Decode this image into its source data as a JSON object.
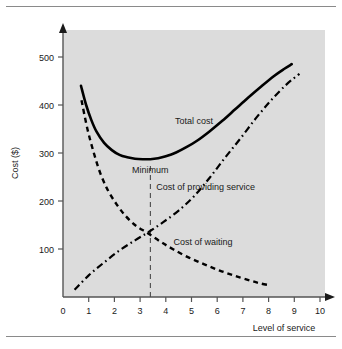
{
  "figure": {
    "background_color": "#ffffff",
    "plot_background_color": "#dcdcdc",
    "rule_color": "#8a8a8a",
    "line_color": "#000000"
  },
  "chart_data": {
    "type": "line",
    "title": "",
    "xlabel": "Level of service",
    "ylabel": "Cost ($)",
    "xlim": [
      0,
      11
    ],
    "ylim": [
      0,
      560
    ],
    "xticks": [
      0,
      1,
      2,
      3,
      4,
      5,
      6,
      7,
      8,
      9,
      10
    ],
    "xtick_labels": [
      "0",
      "1",
      "2",
      "3",
      "4",
      "5",
      "6",
      "7",
      "8",
      "9",
      "10"
    ],
    "yticks": [
      100,
      200,
      300,
      400,
      500
    ],
    "ytick_labels": [
      "100",
      "200",
      "300",
      "400",
      "500"
    ],
    "grid": false,
    "legend_position": "inline-labels",
    "series": [
      {
        "name": "Total cost",
        "style": "solid",
        "label": "Total cost",
        "label_x": 5.1,
        "label_y": 360,
        "points": [
          [
            0.7,
            440
          ],
          [
            0.9,
            400
          ],
          [
            1.1,
            369
          ],
          [
            1.3,
            345
          ],
          [
            1.6,
            321
          ],
          [
            1.9,
            306
          ],
          [
            2.2,
            296
          ],
          [
            2.5,
            291
          ],
          [
            2.8,
            288
          ],
          [
            3.1,
            287
          ],
          [
            3.4,
            287
          ],
          [
            3.7,
            289
          ],
          [
            4.0,
            293
          ],
          [
            4.4,
            301
          ],
          [
            4.8,
            312
          ],
          [
            5.2,
            325
          ],
          [
            5.7,
            345
          ],
          [
            6.2,
            367
          ],
          [
            6.7,
            391
          ],
          [
            7.2,
            415
          ],
          [
            7.7,
            438
          ],
          [
            8.2,
            460
          ],
          [
            8.6,
            475
          ],
          [
            8.9,
            485
          ]
        ]
      },
      {
        "name": "Cost of providing service",
        "style": "dashdot",
        "label": "Cost of providing service",
        "label_x": 5.55,
        "label_y": 222,
        "points": [
          [
            0.45,
            15
          ],
          [
            1.0,
            45
          ],
          [
            1.6,
            72
          ],
          [
            2.2,
            97
          ],
          [
            2.8,
            118
          ],
          [
            3.35,
            136
          ],
          [
            3.9,
            156
          ],
          [
            4.5,
            180
          ],
          [
            5.1,
            210
          ],
          [
            5.7,
            248
          ],
          [
            6.3,
            290
          ],
          [
            6.9,
            330
          ],
          [
            7.5,
            372
          ],
          [
            8.1,
            410
          ],
          [
            8.7,
            443
          ],
          [
            9.2,
            465
          ]
        ]
      },
      {
        "name": "Cost of waiting",
        "style": "dashed",
        "label": "Cost of waiting",
        "label_x": 5.45,
        "label_y": 108,
        "points": [
          [
            0.72,
            410
          ],
          [
            0.95,
            350
          ],
          [
            1.2,
            300
          ],
          [
            1.45,
            258
          ],
          [
            1.75,
            222
          ],
          [
            2.1,
            192
          ],
          [
            2.45,
            168
          ],
          [
            2.85,
            148
          ],
          [
            3.3,
            133
          ],
          [
            3.8,
            115
          ],
          [
            4.3,
            99
          ],
          [
            4.9,
            82
          ],
          [
            5.5,
            68
          ],
          [
            6.1,
            55
          ],
          [
            6.7,
            44
          ],
          [
            7.3,
            34
          ],
          [
            7.7,
            28
          ],
          [
            8.0,
            25
          ]
        ]
      }
    ],
    "annotations": [
      {
        "name": "minimum",
        "text": "Minimum",
        "x": 3.4,
        "y": 258
      },
      {
        "name": "optimal-level",
        "text": "Optimal level",
        "x": 3.0,
        "y": -70
      }
    ],
    "reference_lines": [
      {
        "name": "optimal-level-marker",
        "orientation": "vertical",
        "x": 3.4,
        "y_from": 0,
        "y_to": 275,
        "style": "dashed"
      }
    ]
  }
}
